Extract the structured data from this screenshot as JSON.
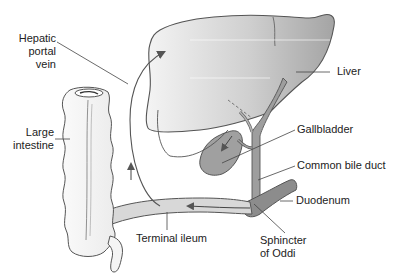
{
  "diagram": {
    "type": "anatomical",
    "colors": {
      "background": "#ffffff",
      "outline": "#555555",
      "liver_fill_light": "#f0f0f0",
      "liver_fill_dark": "#a8a8a8",
      "duct_fill": "#9a9a9a",
      "gallbladder_fill": "#a0a0a0",
      "duodenum_fill": "#8c8c8c",
      "ileum_fill": "#d8d8d8",
      "colon_fill": "#f7f7f7",
      "label_text": "#222222"
    },
    "labels": {
      "hepatic_portal_vein": "Hepatic\nportal\nvein",
      "hepatic_portal_vein_lines": [
        "Hepatic",
        "portal",
        "vein"
      ],
      "liver": "Liver",
      "large_intestine_lines": [
        "Large",
        "intestine"
      ],
      "gallbladder": "Gallbladder",
      "common_bile_duct": "Common bile duct",
      "duodenum": "Duodenum",
      "terminal_ileum": "Terminal ileum",
      "sphincter_of_oddi_lines": [
        "Sphincter",
        "of Oddi"
      ]
    },
    "structures": [
      "liver",
      "hepatic-portal-vein",
      "gallbladder",
      "common-bile-duct",
      "duodenum",
      "sphincter-of-oddi",
      "terminal-ileum",
      "large-intestine"
    ],
    "flow_arrows": [
      {
        "from": "duodenum",
        "to": "terminal-ileum",
        "direction": "left"
      },
      {
        "from": "terminal-ileum",
        "to": "liver",
        "via": "hepatic-portal-vein",
        "direction": "up"
      },
      {
        "from": "common-bile-duct",
        "to": "gallbladder",
        "direction": "down-left"
      }
    ]
  }
}
